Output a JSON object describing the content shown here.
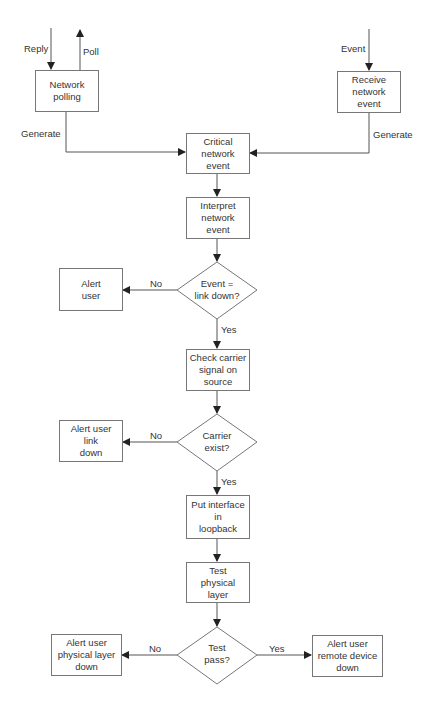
{
  "diagram": {
    "type": "flowchart",
    "nodes": {
      "network_polling": {
        "label": "Network\npolling",
        "shape": "rect"
      },
      "receive_event": {
        "label": "Receive\nnetwork\nevent",
        "shape": "rect"
      },
      "critical_event": {
        "label": "Critical\nnetwork\nevent",
        "shape": "rect"
      },
      "interpret_event": {
        "label": "Interpret\nnetwork\nevent",
        "shape": "rect"
      },
      "decision_link_down": {
        "label": "Event =\nlink down?",
        "shape": "diamond"
      },
      "alert_user": {
        "label": "Alert\nuser",
        "shape": "rect"
      },
      "check_carrier": {
        "label": "Check carrier\nsignal on\nsource",
        "shape": "rect"
      },
      "decision_carrier": {
        "label": "Carrier\nexist?",
        "shape": "diamond"
      },
      "alert_link_down": {
        "label": "Alert user\nlink\ndown",
        "shape": "rect"
      },
      "loopback": {
        "label": "Put interface\nin\nloopback",
        "shape": "rect"
      },
      "test_physical": {
        "label": "Test\nphysical\nlayer",
        "shape": "rect"
      },
      "decision_test_pass": {
        "label": "Test\npass?",
        "shape": "diamond"
      },
      "alert_physical_down": {
        "label": "Alert user\nphysical layer\ndown",
        "shape": "rect"
      },
      "alert_remote_down": {
        "label": "Alert user\nremote device\ndown",
        "shape": "rect"
      }
    },
    "edge_labels": {
      "reply": "Reply",
      "poll": "Poll",
      "event": "Event",
      "generate_left": "Generate",
      "generate_right": "Generate",
      "no_1": "No",
      "yes_1": "Yes",
      "no_2": "No",
      "yes_2": "Yes",
      "no_3": "No",
      "yes_3": "Yes"
    },
    "edges": [
      {
        "from": "external",
        "to": "network_polling",
        "label": "Reply"
      },
      {
        "from": "network_polling",
        "to": "external",
        "label": "Poll"
      },
      {
        "from": "external",
        "to": "receive_event",
        "label": "Event"
      },
      {
        "from": "network_polling",
        "to": "critical_event",
        "label": "Generate"
      },
      {
        "from": "receive_event",
        "to": "critical_event",
        "label": "Generate"
      },
      {
        "from": "critical_event",
        "to": "interpret_event",
        "label": ""
      },
      {
        "from": "interpret_event",
        "to": "decision_link_down",
        "label": ""
      },
      {
        "from": "decision_link_down",
        "to": "alert_user",
        "label": "No"
      },
      {
        "from": "decision_link_down",
        "to": "check_carrier",
        "label": "Yes"
      },
      {
        "from": "check_carrier",
        "to": "decision_carrier",
        "label": ""
      },
      {
        "from": "decision_carrier",
        "to": "alert_link_down",
        "label": "No"
      },
      {
        "from": "decision_carrier",
        "to": "loopback",
        "label": "Yes"
      },
      {
        "from": "loopback",
        "to": "test_physical",
        "label": ""
      },
      {
        "from": "test_physical",
        "to": "decision_test_pass",
        "label": ""
      },
      {
        "from": "decision_test_pass",
        "to": "alert_physical_down",
        "label": "No"
      },
      {
        "from": "decision_test_pass",
        "to": "alert_remote_down",
        "label": "Yes"
      }
    ],
    "colors": {
      "line": "#444444",
      "border": "#777777",
      "text": "#333333",
      "background": "#ffffff"
    }
  }
}
